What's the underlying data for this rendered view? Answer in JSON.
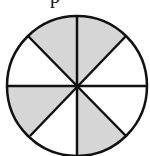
{
  "caption_fragment": "p",
  "diagram": {
    "type": "fraction-circle",
    "total_sectors": 8,
    "shaded_sectors": 4,
    "shade_color": "#d6d6d6",
    "stroke_color": "#111111",
    "sectors": [
      {
        "index": 0,
        "position": "top-left-upper",
        "shaded": true
      },
      {
        "index": 1,
        "position": "top-right-upper",
        "shaded": true
      },
      {
        "index": 2,
        "position": "right-upper",
        "shaded": false
      },
      {
        "index": 3,
        "position": "right-lower",
        "shaded": false
      },
      {
        "index": 4,
        "position": "bottom-right",
        "shaded": true
      },
      {
        "index": 5,
        "position": "bottom-left",
        "shaded": false
      },
      {
        "index": 6,
        "position": "left-lower",
        "shaded": true
      },
      {
        "index": 7,
        "position": "left-upper",
        "shaded": false
      }
    ]
  }
}
